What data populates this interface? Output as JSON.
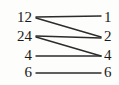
{
  "figure": {
    "type": "bipartite-mapping-diagram",
    "background_color": "#fdfdfc",
    "line_color": "#2b2b2b",
    "text_color": "#1a1a1a",
    "width": 119,
    "height": 85
  },
  "left_column": {
    "values": [
      "12",
      "24",
      "4",
      "6"
    ],
    "x_right_edge": 32,
    "rows_y": [
      18,
      37,
      56,
      73
    ]
  },
  "right_column": {
    "values": [
      "1",
      "2",
      "4",
      "6"
    ],
    "x_left_edge": 103,
    "rows_y": [
      18,
      37,
      56,
      73
    ]
  },
  "edges": [
    {
      "from": "12",
      "to": "1",
      "x1": 36,
      "y1": 17,
      "x2": 101,
      "y2": 16
    },
    {
      "from": "12",
      "to": "2",
      "x1": 36,
      "y1": 18,
      "x2": 101,
      "y2": 37
    },
    {
      "from": "24",
      "to": "2",
      "x1": 36,
      "y1": 36,
      "x2": 101,
      "y2": 38
    },
    {
      "from": "24",
      "to": "4",
      "x1": 36,
      "y1": 37,
      "x2": 101,
      "y2": 56
    },
    {
      "from": "4",
      "to": "4",
      "x1": 36,
      "y1": 56,
      "x2": 101,
      "y2": 56
    },
    {
      "from": "6",
      "to": "6",
      "x1": 36,
      "y1": 73,
      "x2": 101,
      "y2": 73
    }
  ]
}
